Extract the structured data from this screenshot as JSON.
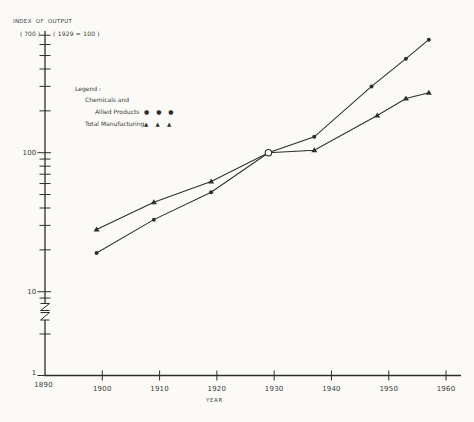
{
  "page": {
    "background": "#fbfaf7",
    "ink": "#2e2e2e",
    "text_color": "#3a3a3a"
  },
  "header": {
    "title": "INDEX OF OUTPUT",
    "y_axis_top_label": "( 700 )",
    "base_year_note": "( 1929 = 100 )"
  },
  "legend": {
    "title": "Legend :",
    "chemicals_line1": "Chemicals and",
    "chemicals_line2": "Allied Products",
    "chemicals_marker_glyph": "● ● ●",
    "total_label": "Total Manufacturing",
    "total_marker_glyph": "▲ ▲ ▲"
  },
  "axes": {
    "x_label": "YEAR"
  },
  "chart_data": {
    "type": "line",
    "xlabel": "YEAR",
    "ylabel": "Index of output (log scale)",
    "y_scale": "log",
    "y_axis_top_value": 700,
    "y_ticks_labeled": [
      100,
      10,
      1
    ],
    "y_axis_break_between": [
      1,
      10
    ],
    "x_ticks": [
      1890,
      1900,
      1910,
      1920,
      1930,
      1940,
      1950,
      1960
    ],
    "x_range": [
      1890,
      1962
    ],
    "grid": false,
    "legend_position": "upper-left",
    "series": [
      {
        "name": "Chemicals and Allied Products",
        "marker": "circle",
        "x": [
          1899,
          1909,
          1919,
          1929,
          1937,
          1947,
          1953,
          1957
        ],
        "values": [
          19,
          33,
          52,
          100,
          130,
          300,
          475,
          650
        ]
      },
      {
        "name": "Total Manufacturing",
        "marker": "triangle",
        "x": [
          1899,
          1909,
          1919,
          1929,
          1937,
          1948,
          1953,
          1957
        ],
        "values": [
          28,
          44,
          62,
          100,
          104,
          185,
          245,
          270
        ]
      }
    ],
    "base_point": {
      "x": 1929,
      "value": 100,
      "marker": "open-circle"
    }
  }
}
